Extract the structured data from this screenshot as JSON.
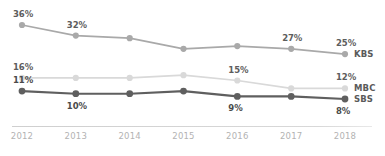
{
  "chart_data": {
    "type": "line",
    "title": "",
    "subtitle": "",
    "xlabel": "",
    "ylabel": "",
    "categories": [
      "2012",
      "2013",
      "2014",
      "2015",
      "2016",
      "2017",
      "2018"
    ],
    "ylim": [
      0,
      40
    ],
    "grid": false,
    "legend_position": "right-end-of-line",
    "value_suffix": "%",
    "series": [
      {
        "name": "KBS",
        "color": "#a9a9a9",
        "values": [
          36,
          32,
          31,
          27,
          28,
          27,
          25
        ],
        "labels": [
          "36%",
          "32%",
          "",
          "",
          "",
          "27%",
          "25%"
        ]
      },
      {
        "name": "MBC",
        "color": "#d9d9d9",
        "values": [
          16,
          16,
          16,
          17,
          15,
          12,
          12
        ],
        "labels": [
          "16%",
          "",
          "",
          "",
          "15%",
          "",
          "12%"
        ]
      },
      {
        "name": "SBS",
        "color": "#5f5f5f",
        "values": [
          11,
          10,
          10,
          11,
          9,
          9,
          8
        ],
        "labels": [
          "11%",
          "10%",
          "",
          "",
          "9%",
          "",
          "8%"
        ]
      }
    ]
  },
  "axis": {
    "tick_color": "#b3b3b3",
    "line_color": "#d4d4d4"
  }
}
